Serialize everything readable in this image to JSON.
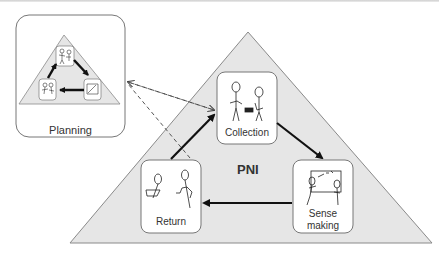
{
  "diagram": {
    "title": "PNI",
    "planning": {
      "label": "Planning"
    },
    "stages": [
      {
        "id": "collection",
        "label": "Collection"
      },
      {
        "id": "sense-making",
        "label": "Sense making",
        "line1": "Sense",
        "line2": "making"
      },
      {
        "id": "return",
        "label": "Return"
      }
    ],
    "colors": {
      "triangle_fill": "#e6e6e6",
      "triangle_stroke": "#8a8a8a",
      "arrow": "#111111",
      "box_stroke": "#777777"
    }
  }
}
